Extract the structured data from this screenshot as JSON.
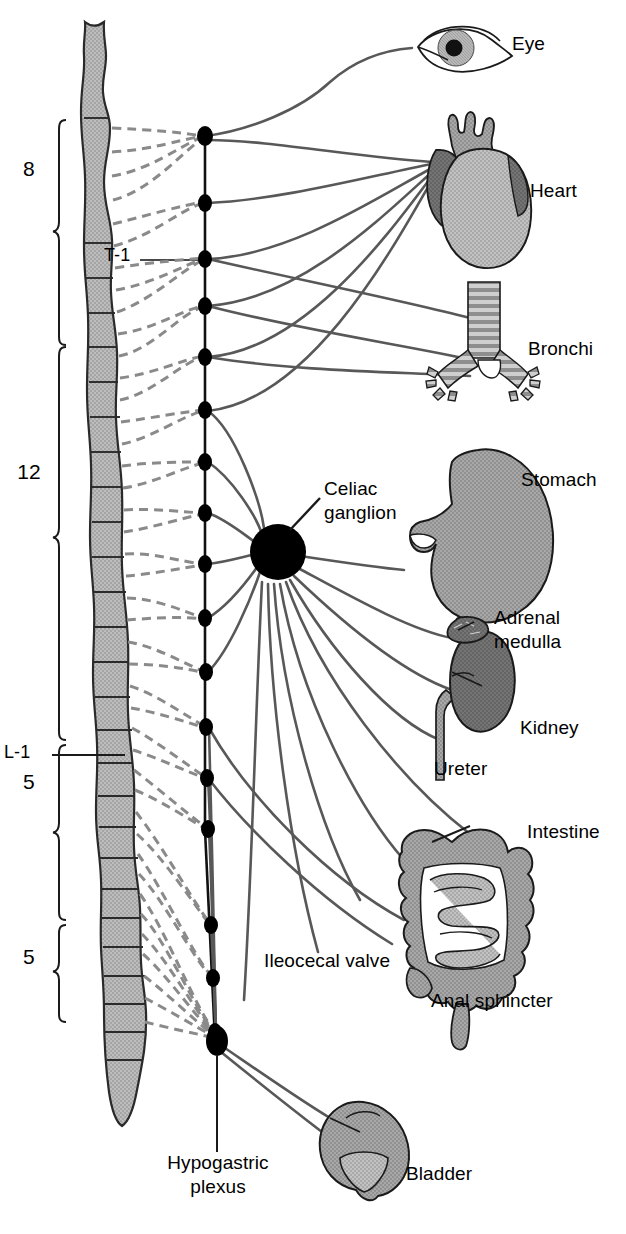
{
  "figure": {
    "type": "anatomical-diagram"
  },
  "spinal_cord": {
    "segment_markers": [
      {
        "name": "t1-label",
        "text": "T-1"
      },
      {
        "name": "l1-label",
        "text": "L-1"
      }
    ],
    "region_braces": [
      {
        "name": "cervical-thoracic-count",
        "text": "8",
        "region": "upper"
      },
      {
        "name": "thoracic-count",
        "text": "12",
        "region": "middle"
      },
      {
        "name": "lumbar-count",
        "text": "5",
        "region": "lumbar"
      },
      {
        "name": "sacral-count",
        "text": "5",
        "region": "sacral"
      }
    ]
  },
  "ganglia": {
    "celiac": {
      "label": "Celiac\nganglion",
      "line1": "Celiac",
      "line2": "ganglion"
    },
    "hypogastric": {
      "label": "Hypogastric\nplexus",
      "line1": "Hypogastric",
      "line2": "plexus"
    },
    "chain_count": 17
  },
  "organs": [
    {
      "name": "eye",
      "label": "Eye"
    },
    {
      "name": "heart",
      "label": "Heart"
    },
    {
      "name": "bronchi",
      "label": "Bronchi"
    },
    {
      "name": "stomach",
      "label": "Stomach"
    },
    {
      "name": "adrenal-medulla",
      "label": "Adrenal\nmedulla",
      "line1": "Adrenal",
      "line2": "medulla"
    },
    {
      "name": "kidney",
      "label": "Kidney"
    },
    {
      "name": "ureter",
      "label": "Ureter"
    },
    {
      "name": "intestine",
      "label": "Intestine"
    },
    {
      "name": "ileocecal-valve",
      "label": "Ileocecal valve"
    },
    {
      "name": "anal-sphincter",
      "label": "Anal sphincter"
    },
    {
      "name": "bladder",
      "label": "Bladder"
    }
  ],
  "colors": {
    "line_dark": "#555555",
    "dashed_gray": "#8a8a8a",
    "cord_fill": "#b3b3b3",
    "organ_light": "#b5b5b5",
    "organ_mid": "#9a9a9a",
    "organ_dark": "#6e6e6e",
    "outline": "#1a1a1a",
    "background": "#ffffff"
  }
}
